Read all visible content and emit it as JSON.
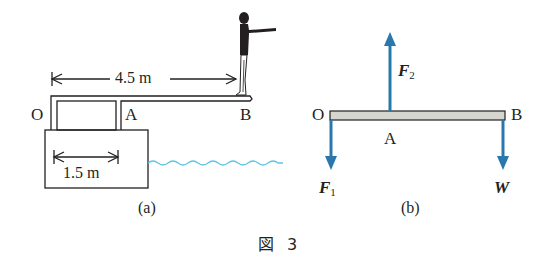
{
  "figure": {
    "caption": "図 3",
    "colors": {
      "ink": "#231f20",
      "force_arrow": "#2a77ad",
      "water": "#5ec4e6",
      "beam_fill": "#d6d6d0"
    }
  },
  "panel_a": {
    "caption": "(a)",
    "labels": {
      "O": "O",
      "A": "A",
      "B": "B"
    },
    "dimensions": [
      {
        "label": "4.5 m",
        "from": "O",
        "to": "B"
      },
      {
        "label": "1.5 m",
        "from": "O",
        "to": "A"
      }
    ],
    "elements": [
      "diving-board",
      "support-post",
      "base-block",
      "diver",
      "water-surface"
    ]
  },
  "panel_b": {
    "caption": "(b)",
    "labels": {
      "O": "O",
      "A": "A",
      "B": "B"
    },
    "forces": [
      {
        "name": "F",
        "sub": "2",
        "direction": "up",
        "at": "A"
      },
      {
        "name": "F",
        "sub": "1",
        "direction": "down",
        "at": "O"
      },
      {
        "name": "W",
        "sub": "",
        "direction": "down",
        "at": "B"
      }
    ]
  }
}
